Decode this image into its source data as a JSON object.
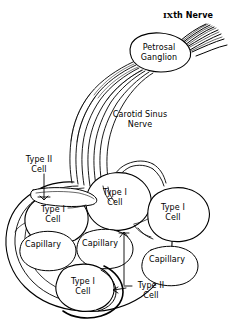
{
  "figure": {
    "line_color": "#000000",
    "background_color": "#ffffff"
  },
  "labels": {
    "nerve_ix": "IXth Nerve",
    "nerve_ix_numeral": "IX",
    "nerve_ix_suffix": "th Nerve",
    "petrosal_ganglion": "Petrosal\nGanglion",
    "carotid_sinus_nerve": "Carotid Sinus\nNerve",
    "type_ii_cell_left": "Type II\nCell",
    "type_i_cell_center_top": "Type I\nCell",
    "type_i_cell_right": "Type I\nCell",
    "type_i_cell_left": "Type I\nCell",
    "capillary_left": "Capillary",
    "capillary_center": "Capillary",
    "capillary_right": "Capillary",
    "type_i_cell_bottom": "Type I\nCell",
    "type_ii_cell_bottom": "Type II\nCell"
  }
}
